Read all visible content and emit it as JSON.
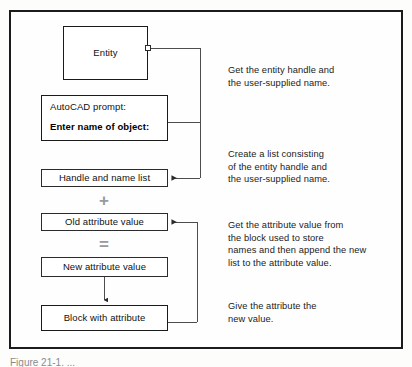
{
  "figure": {
    "caption": "Figure  21-1.  ..."
  },
  "diagram": {
    "nodes": {
      "entity": {
        "label": "Entity"
      },
      "prompt": {
        "line1": "AutoCAD prompt:",
        "line2": "Enter name of object:"
      },
      "handle_list": {
        "label": "Handle and name list"
      },
      "old_attribute": {
        "label": "Old attribute value"
      },
      "new_attribute": {
        "label": "New attribute value"
      },
      "block_attribute": {
        "label": "Block with attribute"
      }
    },
    "operators": {
      "plus": "+",
      "equals": "="
    },
    "notes": [
      {
        "text": "Get the entity handle and\nthe user-supplied name."
      },
      {
        "text": "Create a list consisting\nof the entity handle and\nthe user-supplied name."
      },
      {
        "text": "Get the attribute value from\nthe block used to store\nnames and then append the new\nlist to the attribute value."
      },
      {
        "text": "Give the attribute the\nnew value."
      }
    ],
    "colors": {
      "ink": "#1b1b1b",
      "wire": "#3a3a3a",
      "operator": "#9a9a9a",
      "paper": "#fefefe"
    }
  }
}
